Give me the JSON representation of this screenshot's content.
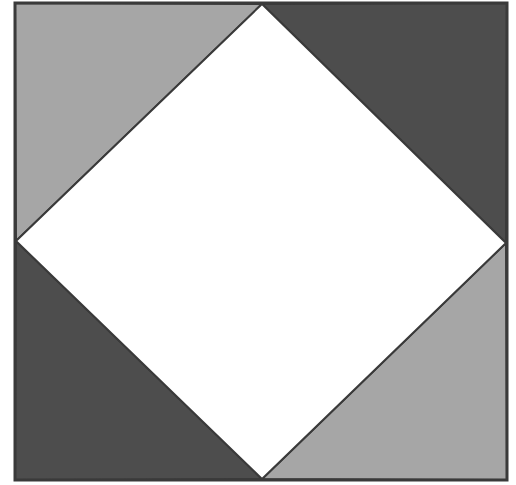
{
  "diagram": {
    "type": "square-in-square",
    "outer_square": {
      "x": 15,
      "y": 3,
      "width": 492,
      "height": 477
    },
    "inner_diamond": {
      "vertices": [
        [
          262,
          4
        ],
        [
          506,
          243
        ],
        [
          262,
          479
        ],
        [
          16,
          241
        ]
      ],
      "fill": "#ffffff"
    },
    "corner_triangles": [
      {
        "position": "top-left",
        "shade": "light",
        "fill": "#a6a6a6"
      },
      {
        "position": "top-right",
        "shade": "dark",
        "fill": "#4d4d4d"
      },
      {
        "position": "bottom-left",
        "shade": "dark",
        "fill": "#4d4d4d"
      },
      {
        "position": "bottom-right",
        "shade": "light",
        "fill": "#a6a6a6"
      }
    ],
    "stroke": "#3a3a3a",
    "stroke_width": 2
  }
}
